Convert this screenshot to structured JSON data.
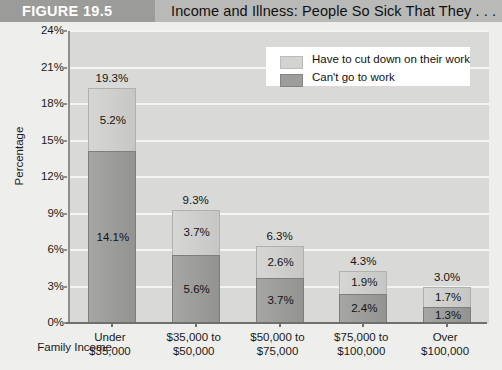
{
  "figure": {
    "number_label": "FIGURE 19.5",
    "title": "Income and Illness: People So Sick That They . . ."
  },
  "chart_data": {
    "type": "bar",
    "subtype": "stacked-vertical",
    "title": "Income and Illness: People So Sick That They . . .",
    "xlabel": "Family Income",
    "ylabel": "Percentage",
    "ylim": [
      0,
      24
    ],
    "ytick_labels": [
      "0%",
      "3%",
      "6%",
      "9%",
      "12%",
      "15%",
      "18%",
      "21%",
      "24%"
    ],
    "ytick_values": [
      0,
      3,
      6,
      9,
      12,
      15,
      18,
      21,
      24
    ],
    "grid": true,
    "legend_position": "top-right",
    "categories": [
      "Under\n$35,000",
      "$35,000 to\n$50,000",
      "$50,000 to\n$75,000",
      "$75,000 to\n$100,000",
      "Over\n$100,000"
    ],
    "category_lines": [
      [
        "Under",
        "$35,000"
      ],
      [
        "$35,000 to",
        "$50,000"
      ],
      [
        "$50,000 to",
        "$75,000"
      ],
      [
        "$75,000 to",
        "$100,000"
      ],
      [
        "Over",
        "$100,000"
      ]
    ],
    "series": [
      {
        "name": "Can't go to work",
        "color": "#9d9d9b",
        "values": [
          14.1,
          5.6,
          3.7,
          2.4,
          1.3
        ],
        "labels": [
          "14.1%",
          "5.6%",
          "3.7%",
          "2.4%",
          "1.3%"
        ]
      },
      {
        "name": "Have to cut down on their work",
        "color": "#d3d3d1",
        "values": [
          5.2,
          3.7,
          2.6,
          1.9,
          1.7
        ],
        "labels": [
          "5.2%",
          "3.7%",
          "2.6%",
          "1.9%",
          "1.7%"
        ]
      }
    ],
    "totals": [
      19.3,
      9.3,
      6.3,
      4.3,
      3.0
    ],
    "total_labels": [
      "19.3%",
      "9.3%",
      "6.3%",
      "4.3%",
      "3.0%"
    ]
  },
  "legend": {
    "items": [
      {
        "label": "Have to cut down on their work",
        "swatch": "light"
      },
      {
        "label": "Can't go to work",
        "swatch": "dark"
      }
    ]
  }
}
